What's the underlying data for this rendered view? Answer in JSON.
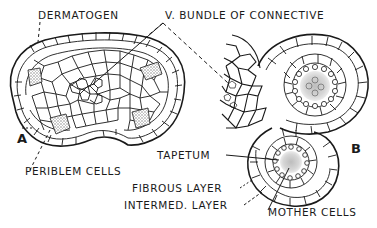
{
  "figure": {
    "panels": [
      {
        "id": "A",
        "label": "A"
      },
      {
        "id": "B",
        "label": "B"
      }
    ],
    "labels": {
      "dermatogen": "DERMATOGEN",
      "vascular_bundle": "V. BUNDLE OF CONNECTIVE",
      "periblem_cells": "PERIBLEM CELLS",
      "tapetum": "TAPETUM",
      "fibrous_layer": "FIBROUS LAYER",
      "intermed_layer": "INTERMED. LAYER",
      "mother_cells": "MOTHER CELLS"
    },
    "colors": {
      "ink": "#1a1a1a",
      "stipple": "#b8b8b8",
      "background": "#ffffff"
    }
  }
}
